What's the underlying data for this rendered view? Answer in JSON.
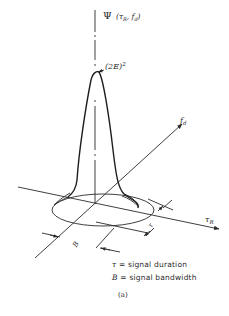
{
  "figure": {
    "function_label": "Ψ (τR, fd)",
    "function_symbol": "Ψ",
    "function_args": "(τR, fd)",
    "peak_label": "(2E)²",
    "peak_label_base": "(2E)",
    "peak_label_exp": "2",
    "axis_tr_label": "τR",
    "axis_tr_main": "τ",
    "axis_tr_sub": "R",
    "axis_fd_label": "fd",
    "axis_fd_main": "f",
    "axis_fd_sub": "d",
    "dim_tau_label": "τ",
    "dim_b_label": "B",
    "caption": "(a)"
  },
  "legend": {
    "items": [
      {
        "symbol": "τ",
        "text": "= signal duration"
      },
      {
        "symbol": "B",
        "text": "= signal bandwidth"
      }
    ]
  },
  "colors": {
    "ink": "#2a2a2a",
    "background": "#ffffff"
  }
}
